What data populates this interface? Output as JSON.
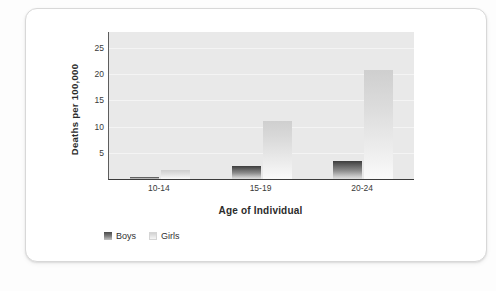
{
  "chart_data": {
    "type": "bar",
    "title": "",
    "xlabel": "Age of Individual",
    "ylabel": "Deaths per 100,000",
    "categories": [
      "10-14",
      "15-19",
      "20-24"
    ],
    "series": [
      {
        "name": "Boys",
        "values": [
          0.4,
          2.5,
          3.5
        ],
        "color": "#5a5a5a"
      },
      {
        "name": "Girls",
        "values": [
          1.7,
          11.0,
          20.7
        ],
        "color": "#dcdcdc"
      }
    ],
    "yticks": [
      5,
      10,
      15,
      20,
      25
    ],
    "ylim": [
      0,
      28
    ],
    "grid": true,
    "legend_position": "bottom-left",
    "legend": [
      "Boys",
      "Girls"
    ]
  },
  "axes": {
    "y_title": "Deaths per 100,000",
    "x_title": "Age of Individual",
    "y_tick_labels": [
      "25",
      "20",
      "15",
      "10",
      "5"
    ],
    "x_tick_labels": [
      "10-14",
      "15-19",
      "20-24"
    ]
  },
  "legend": {
    "items": [
      {
        "label": "Boys"
      },
      {
        "label": "Girls"
      }
    ]
  }
}
